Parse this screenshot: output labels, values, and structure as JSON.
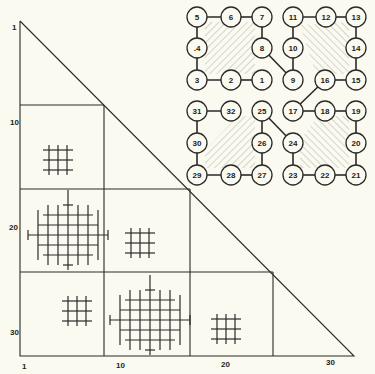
{
  "colors": {
    "background": "#fbfaf0",
    "ink": "#2a2a2a",
    "hatch": "#9a9a90"
  },
  "triangle": {
    "apex": [
      20,
      21
    ],
    "bottom_left": [
      20,
      356
    ],
    "bottom_right": [
      354,
      356
    ],
    "block_lines": {
      "horizontal": [
        {
          "y": 105,
          "x1": 20,
          "x2": 104
        },
        {
          "y": 189,
          "x1": 20,
          "x2": 190
        },
        {
          "y": 272,
          "x1": 20,
          "x2": 273
        }
      ],
      "vertical": [
        {
          "x": 104,
          "y1": 105,
          "y2": 356
        },
        {
          "x": 190,
          "y1": 189,
          "y2": 356
        },
        {
          "x": 273,
          "y1": 272,
          "y2": 356
        }
      ]
    }
  },
  "axis_labels": {
    "left": [
      {
        "text": "1",
        "x": 12,
        "y": 30
      },
      {
        "text": "10",
        "x": 10,
        "y": 125
      },
      {
        "text": "20",
        "x": 9,
        "y": 230
      },
      {
        "text": "30",
        "x": 10,
        "y": 335
      }
    ],
    "bottom": [
      {
        "text": "1",
        "x": 22,
        "y": 369
      },
      {
        "text": "10",
        "x": 116,
        "y": 368
      },
      {
        "text": "20",
        "x": 221,
        "y": 367
      },
      {
        "text": "30",
        "x": 326,
        "y": 365
      }
    ]
  },
  "glyphs": [
    {
      "type": "small-grid",
      "block": "row2-col1",
      "cx": 58,
      "cy": 160
    },
    {
      "type": "large-diamond-grid",
      "block": "row3-col1",
      "cx": 68,
      "cy": 235
    },
    {
      "type": "small-grid",
      "block": "row3-col2",
      "cx": 140,
      "cy": 243
    },
    {
      "type": "small-grid",
      "block": "row4-col1",
      "cx": 77,
      "cy": 311
    },
    {
      "type": "large-diamond-grid",
      "block": "row4-col2",
      "cx": 150,
      "cy": 320
    },
    {
      "type": "small-grid",
      "block": "row4-col3",
      "cx": 226,
      "cy": 329
    }
  ],
  "clusters": [
    {
      "name": "cluster-1-8",
      "nodes": [
        {
          "label": "5",
          "x": 197,
          "y": 17
        },
        {
          "label": "6",
          "x": 231,
          "y": 17
        },
        {
          "label": "7",
          "x": 262,
          "y": 17
        },
        {
          "label": ".4",
          "x": 197,
          "y": 48
        },
        {
          "label": "8",
          "x": 262,
          "y": 48
        },
        {
          "label": "3",
          "x": 197,
          "y": 80
        },
        {
          "label": "2",
          "x": 231,
          "y": 80
        },
        {
          "label": "1",
          "x": 262,
          "y": 80
        }
      ],
      "hatch_polygon": [
        [
          205,
          22
        ],
        [
          255,
          22
        ],
        [
          255,
          74
        ],
        [
          205,
          74
        ]
      ]
    },
    {
      "name": "cluster-9-16",
      "nodes": [
        {
          "label": "11",
          "x": 293,
          "y": 17
        },
        {
          "label": "12",
          "x": 326,
          "y": 17
        },
        {
          "label": "13",
          "x": 356,
          "y": 17
        },
        {
          "label": "10",
          "x": 293,
          "y": 48
        },
        {
          "label": "14",
          "x": 356,
          "y": 48
        },
        {
          "label": "9",
          "x": 293,
          "y": 80
        },
        {
          "label": "16",
          "x": 325,
          "y": 80
        },
        {
          "label": "15",
          "x": 356,
          "y": 80
        }
      ],
      "hatch_polygon": [
        [
          300,
          25
        ],
        [
          349,
          22
        ],
        [
          349,
          74
        ],
        [
          316,
          74
        ]
      ]
    },
    {
      "name": "cluster-25-32",
      "nodes": [
        {
          "label": "31",
          "x": 197,
          "y": 111
        },
        {
          "label": "32",
          "x": 231,
          "y": 111
        },
        {
          "label": "25",
          "x": 262,
          "y": 111
        },
        {
          "label": "30",
          "x": 197,
          "y": 143
        },
        {
          "label": "26",
          "x": 262,
          "y": 143
        },
        {
          "label": "29",
          "x": 197,
          "y": 175
        },
        {
          "label": "28",
          "x": 231,
          "y": 175
        },
        {
          "label": "27",
          "x": 262,
          "y": 175
        }
      ],
      "hatch_polygon": [
        [
          238,
          116
        ],
        [
          255,
          116
        ],
        [
          255,
          168
        ],
        [
          205,
          168
        ],
        [
          205,
          150
        ]
      ]
    },
    {
      "name": "cluster-17-24",
      "nodes": [
        {
          "label": "17",
          "x": 293,
          "y": 111
        },
        {
          "label": "18",
          "x": 325,
          "y": 111
        },
        {
          "label": "19",
          "x": 356,
          "y": 111
        },
        {
          "label": "24",
          "x": 293,
          "y": 143
        },
        {
          "label": "20",
          "x": 356,
          "y": 143
        },
        {
          "label": "23",
          "x": 293,
          "y": 175
        },
        {
          "label": "22",
          "x": 325,
          "y": 175
        },
        {
          "label": "21",
          "x": 356,
          "y": 175
        }
      ],
      "hatch_polygon": [
        [
          300,
          168
        ],
        [
          349,
          168
        ],
        [
          349,
          116
        ],
        [
          318,
          116
        ],
        [
          300,
          140
        ]
      ]
    }
  ],
  "edges": [
    [
      "5",
      "6"
    ],
    [
      "6",
      "7"
    ],
    [
      "7",
      "8"
    ],
    [
      "8",
      "9"
    ],
    [
      "1",
      "2"
    ],
    [
      "2",
      "3"
    ],
    [
      "3",
      ".4"
    ],
    [
      ".4",
      "5"
    ],
    [
      "11",
      "12"
    ],
    [
      "12",
      "13"
    ],
    [
      "13",
      "14"
    ],
    [
      "14",
      "15"
    ],
    [
      "15",
      "16"
    ],
    [
      "16",
      "17"
    ],
    [
      "11",
      "10"
    ],
    [
      "10",
      "9"
    ],
    [
      "17",
      "18"
    ],
    [
      "18",
      "19"
    ],
    [
      "19",
      "20"
    ],
    [
      "20",
      "21"
    ],
    [
      "21",
      "22"
    ],
    [
      "22",
      "23"
    ],
    [
      "23",
      "24"
    ],
    [
      "24",
      "25"
    ],
    [
      "25",
      "26"
    ],
    [
      "26",
      "27"
    ],
    [
      "27",
      "28"
    ],
    [
      "28",
      "29"
    ],
    [
      "29",
      "30"
    ],
    [
      "30",
      "31"
    ],
    [
      "31",
      "32"
    ]
  ]
}
